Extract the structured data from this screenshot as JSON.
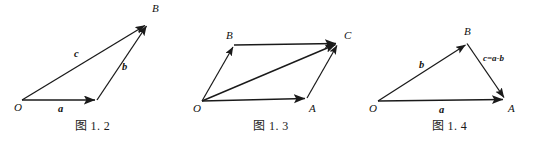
{
  "page": {
    "width": 542,
    "height": 141,
    "background": "#ffffff",
    "stroke_color": "#1a1a1a",
    "text_color": "#111111"
  },
  "figures": [
    {
      "id": "fig-1",
      "caption": "图 1. 2",
      "description": "triangle-vector-addition",
      "points": [
        {
          "name": "O",
          "label": "O",
          "x": 22,
          "y": 100,
          "label_x": 14,
          "label_y": 111
        },
        {
          "name": "B",
          "label": "B",
          "x": 148,
          "y": 24,
          "label_x": 152,
          "label_y": 12
        },
        {
          "name": "A",
          "label": "",
          "x": 97,
          "y": 100,
          "label_x": 0,
          "label_y": 0
        }
      ],
      "vectors": [
        {
          "name": "a",
          "label": "a",
          "from": "O",
          "to": "A",
          "label_x": 58,
          "label_y": 112,
          "arrow": true
        },
        {
          "name": "b",
          "label": "b",
          "from": "A",
          "to": "B",
          "label_x": 122,
          "label_y": 70,
          "arrow": true
        },
        {
          "name": "c",
          "label": "c",
          "from": "O",
          "to": "B",
          "label_x": 74,
          "label_y": 57,
          "arrow": true
        }
      ]
    },
    {
      "id": "fig-2",
      "caption": "图 1. 3",
      "description": "parallelogram-vector-addition",
      "points": [
        {
          "name": "O",
          "label": "O",
          "x": 17,
          "y": 101,
          "label_x": 8,
          "label_y": 112
        },
        {
          "name": "A",
          "label": "A",
          "x": 122,
          "y": 98,
          "label_x": 124,
          "label_y": 112
        },
        {
          "name": "B",
          "label": "B",
          "x": 49,
          "y": 45,
          "label_x": 41,
          "label_y": 39
        },
        {
          "name": "C",
          "label": "C",
          "x": 153,
          "y": 43,
          "label_x": 159,
          "label_y": 39
        }
      ],
      "vectors": [
        {
          "name": "OA",
          "label": "",
          "from": "O",
          "to": "A",
          "arrow": true
        },
        {
          "name": "OB",
          "label": "",
          "from": "O",
          "to": "B",
          "arrow": true
        },
        {
          "name": "BC",
          "label": "",
          "from": "B",
          "to": "C",
          "arrow": true
        },
        {
          "name": "AC",
          "label": "",
          "from": "A",
          "to": "C",
          "arrow": true
        },
        {
          "name": "OC",
          "label": "",
          "from": "O",
          "to": "C",
          "arrow": true
        }
      ]
    },
    {
      "id": "fig-3",
      "caption": "图 1. 4",
      "description": "triangle-vector-subtraction",
      "points": [
        {
          "name": "O",
          "label": "O",
          "x": 21,
          "y": 101,
          "label_x": 12,
          "label_y": 112
        },
        {
          "name": "A",
          "label": "A",
          "x": 148,
          "y": 99,
          "label_x": 151,
          "label_y": 112
        },
        {
          "name": "B",
          "label": "B",
          "x": 110,
          "y": 43,
          "label_x": 110,
          "label_y": 35
        }
      ],
      "vectors": [
        {
          "name": "a",
          "label": "a",
          "from": "O",
          "to": "A",
          "label_x": 82,
          "label_y": 113,
          "arrow": true
        },
        {
          "name": "b",
          "label": "b",
          "from": "O",
          "to": "B",
          "label_x": 62,
          "label_y": 68,
          "arrow": true
        },
        {
          "name": "c",
          "label": "c=a-b",
          "from": "B",
          "to": "A",
          "label_x": 128,
          "label_y": 62,
          "arrow": true
        }
      ]
    }
  ]
}
